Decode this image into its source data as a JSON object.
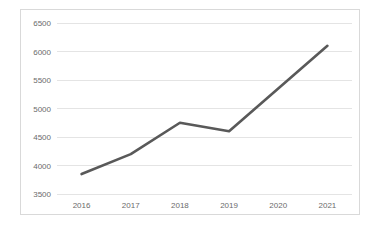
{
  "chart_data": {
    "type": "line",
    "title": "",
    "xlabel": "",
    "ylabel": "",
    "categories": [
      "2016",
      "2017",
      "2018",
      "2019",
      "2020",
      "2021"
    ],
    "values": [
      3850,
      4200,
      4750,
      4600,
      5350,
      6100
    ],
    "series": [
      {
        "name": "Series 1",
        "values": [
          3850,
          4200,
          4750,
          4600,
          5350,
          6100
        ]
      }
    ],
    "ylim": [
      3500,
      6500
    ],
    "y_ticks": [
      "3500",
      "4000",
      "4500",
      "5000",
      "5500",
      "6000",
      "6500"
    ],
    "y_tick_values": [
      3500,
      4000,
      4500,
      5000,
      5500,
      6000,
      6500
    ],
    "x_ticks": [
      "2016",
      "2017",
      "2018",
      "2019",
      "2020",
      "2021"
    ],
    "grid": "horizontal",
    "legend": "none",
    "line_color": "#595959",
    "grid_color": "#e4e4e4",
    "border_color": "#d9d9d9",
    "tick_label_color": "#6b6b6b",
    "background_color": "#ffffff"
  }
}
